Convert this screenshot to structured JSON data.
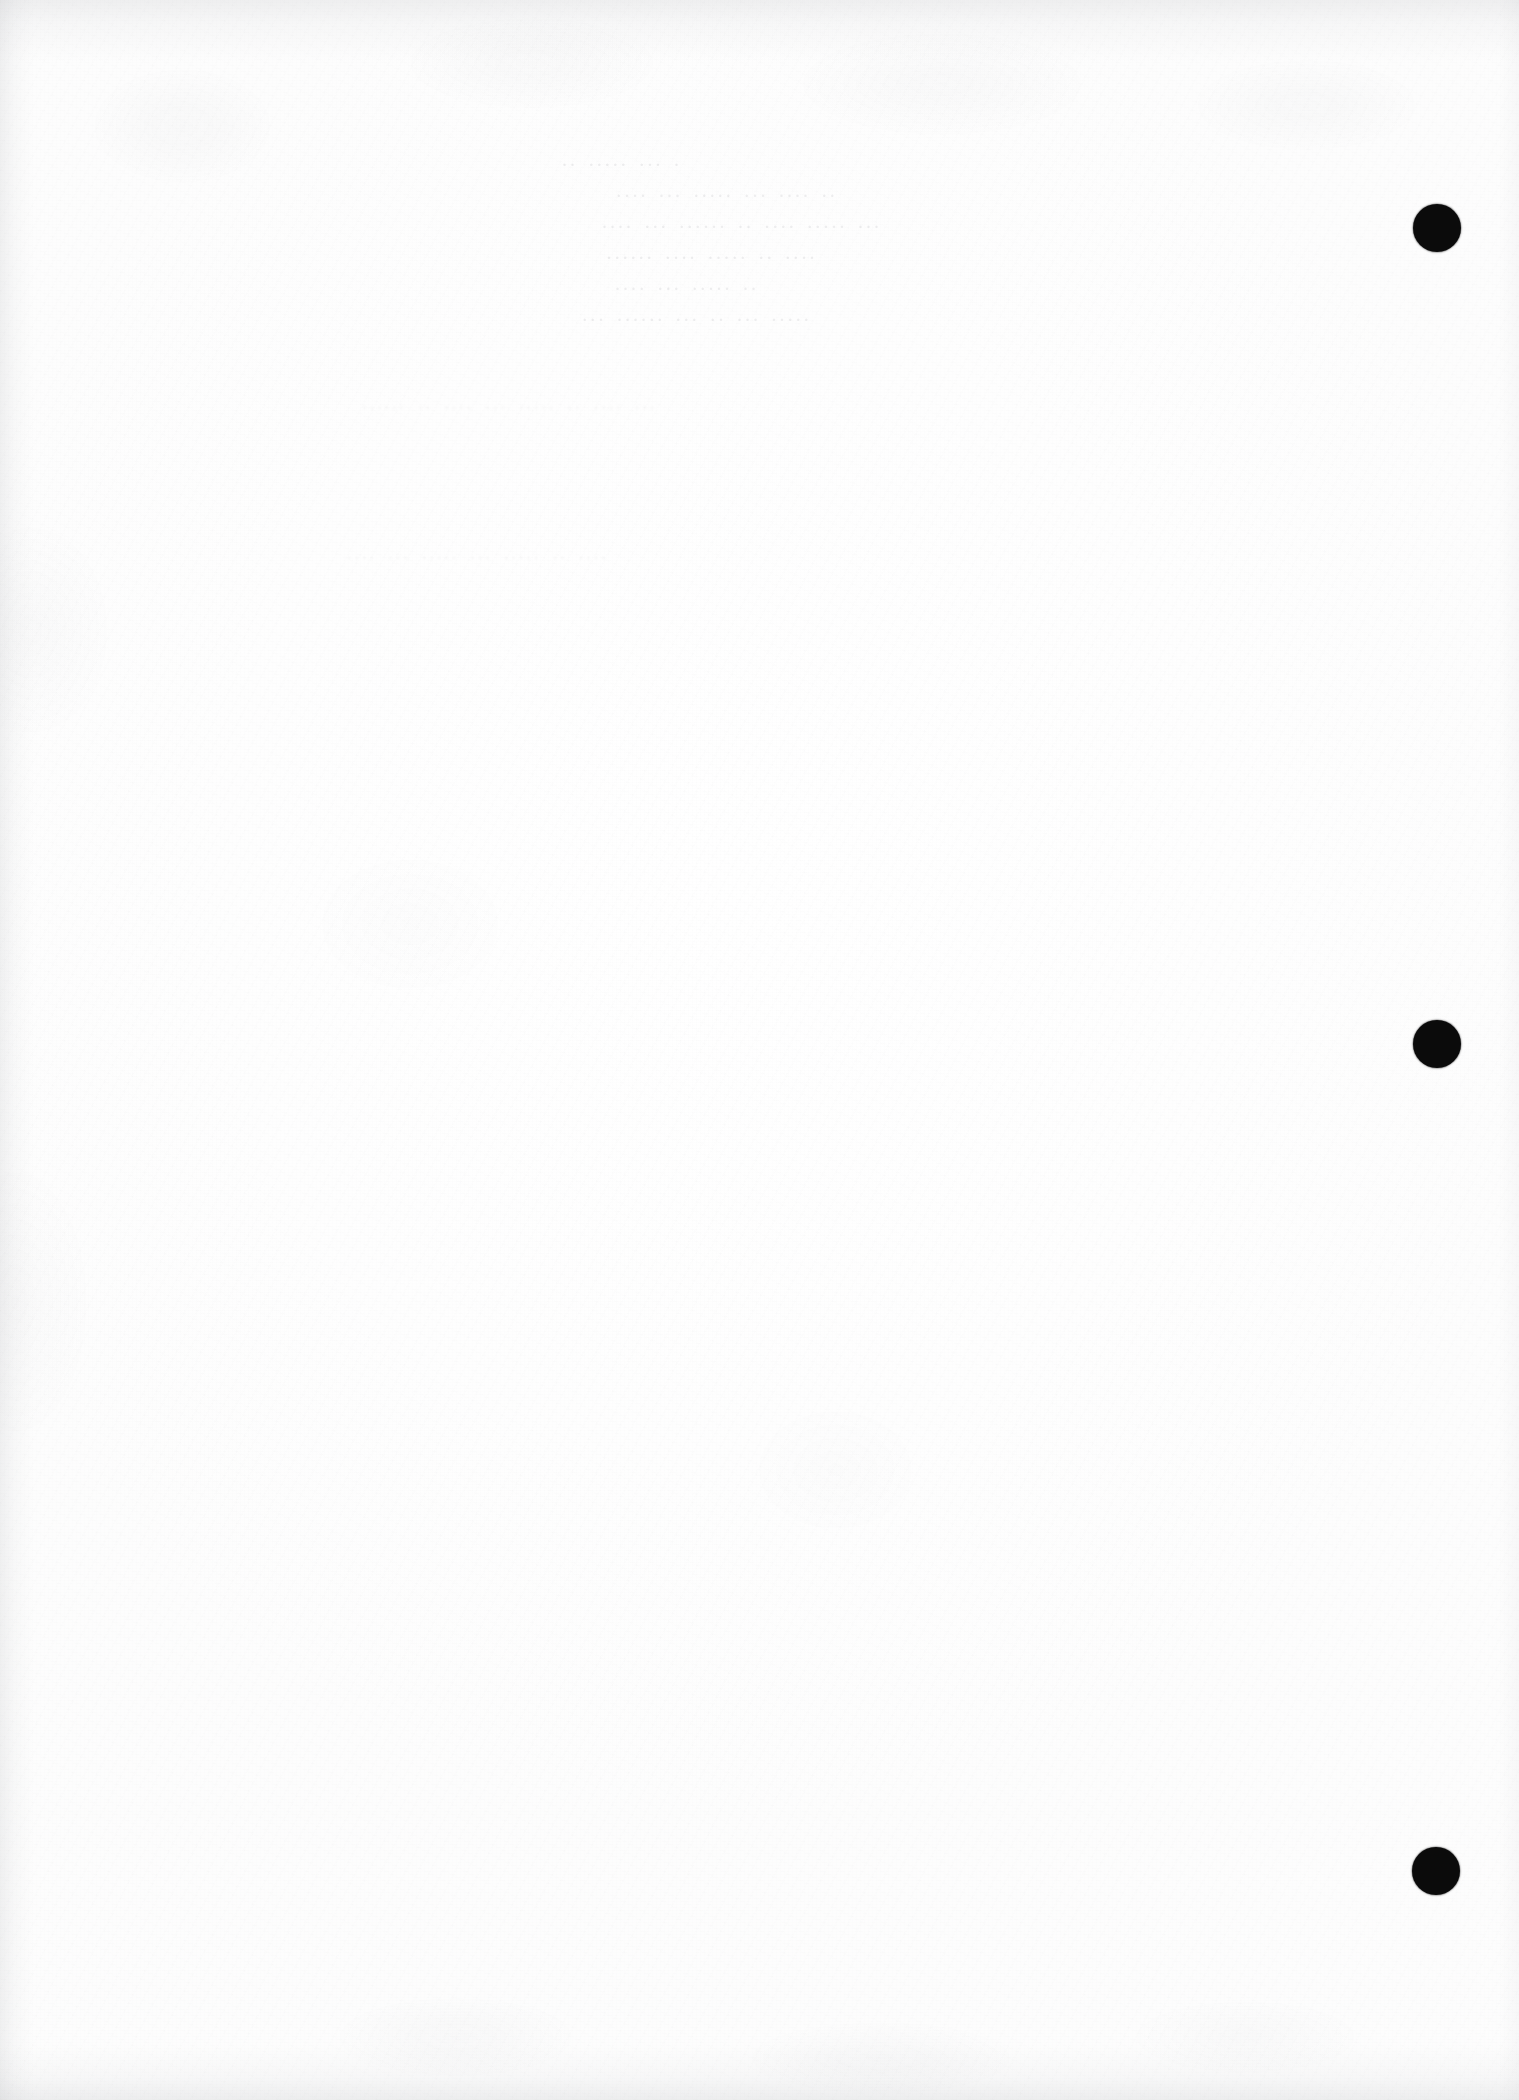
{
  "document": {
    "kind": "scanned-page",
    "page_label": "blank verso",
    "width_px": 1519,
    "height_px": 2100,
    "background_color": "#fefefe",
    "ink_color": "#0b0b0b",
    "shadow_color": "#8c8e94"
  },
  "ghost_text": {
    "note": "bleed-through from the reverse side; mirrored and nearly illegible",
    "title_block": [
      "· ··· ····· ··",
      "·· ···· ··· ····· ··· ····",
      "··· ····· ···· ·· ······ ··· ····",
      "···· ·· ····· ···· ······",
      "·· ····· ··· ····",
      "····· ··· ·· ··· ······ ···"
    ],
    "body_lines": [
      "··· ···· ·· ····· ··· ···· ·· ······",
      "···· ·· ····· ··· ····· ··· ····"
    ]
  },
  "punch_holes": {
    "count": 3,
    "diameter_px": 48,
    "color": "#0b0b0b",
    "positions": [
      {
        "cx": 1437,
        "cy": 228
      },
      {
        "cx": 1437,
        "cy": 1044
      },
      {
        "cx": 1436,
        "cy": 1871
      }
    ]
  }
}
